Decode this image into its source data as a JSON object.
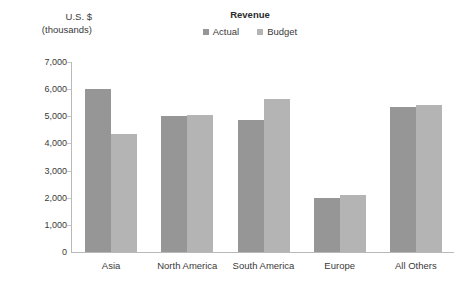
{
  "chart_data": {
    "type": "bar",
    "title": "Revenue",
    "xlabel": "",
    "ylabel": "U.S. $ (thousands)",
    "ylabel_line1": "U.S. $",
    "ylabel_line2": "(thousands)",
    "categories": [
      "Asia",
      "North America",
      "South America",
      "Europe",
      "All Others"
    ],
    "series": [
      {
        "name": "Actual",
        "color": "#969696",
        "values": [
          6000,
          5000,
          4870,
          2000,
          5350
        ]
      },
      {
        "name": "Budget",
        "color": "#b4b4b4",
        "values": [
          4350,
          5050,
          5650,
          2100,
          5400
        ]
      }
    ],
    "ylim": [
      0,
      7000
    ],
    "ytick_values": [
      0,
      1000,
      2000,
      3000,
      4000,
      5000,
      6000,
      7000
    ],
    "ytick_labels": [
      "0",
      "1,000",
      "2,000",
      "3,000",
      "4,000",
      "5,000",
      "6,000",
      "7,000"
    ],
    "grid": false,
    "legend_position": "top-center",
    "axis_color": "#b9b9b9"
  }
}
